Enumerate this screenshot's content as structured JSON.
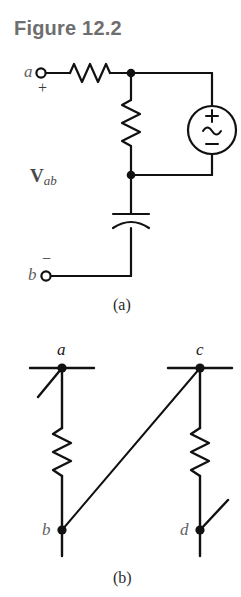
{
  "figure": {
    "title": "Figure 12.2",
    "title_color": "#6e6e6e"
  },
  "circuit_a": {
    "caption": "(a)",
    "terminal_a_label": "a",
    "terminal_a_polarity": "+",
    "terminal_b_label": "b",
    "terminal_b_polarity": "−",
    "voltage_label_main": "V",
    "voltage_label_sub": "ab",
    "source": {
      "plus": "+",
      "wave": "∼",
      "minus": "−"
    },
    "components": [
      "series-resistor",
      "shunt-resistor",
      "ac-voltage-source",
      "series-capacitor"
    ]
  },
  "circuit_b": {
    "caption": "(b)",
    "nodes": [
      {
        "id": "node-a",
        "label": "a"
      },
      {
        "id": "node-c",
        "label": "c"
      },
      {
        "id": "node-b",
        "label": "b"
      },
      {
        "id": "node-d",
        "label": "d"
      }
    ],
    "components": [
      "resistor-ab",
      "resistor-cd",
      "wire-c-to-b"
    ]
  },
  "colors": {
    "ink": "#111111",
    "label": "#5f5f5f",
    "title": "#6e6e6e",
    "background": "#ffffff"
  }
}
